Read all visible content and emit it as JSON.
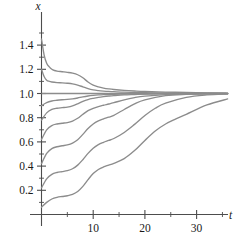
{
  "figure": {
    "kind": "line-plot",
    "background_color": "#ffffff",
    "curve_color": "#8c8c8c",
    "axis_color": "#4d4d4d",
    "text_color": "#1a1a1a"
  },
  "chart_data": {
    "type": "line",
    "title": "",
    "xlabel": "t",
    "ylabel": "x",
    "xlim": [
      -1.2,
      36.5
    ],
    "ylim": [
      0,
      1.52
    ],
    "grid": false,
    "legend": null,
    "x_ticks_major": [
      10,
      20,
      30
    ],
    "x_ticks_minor": [
      5,
      15,
      25,
      35
    ],
    "x_tick_labels": [
      "10",
      "20",
      "30"
    ],
    "y_ticks_major": [
      0.2,
      0.4,
      0.6,
      0.8,
      1.0,
      1.2,
      1.4
    ],
    "y_tick_labels": [
      "0.2",
      "0.4",
      "0.6",
      "0.8",
      "1.0",
      "1.2",
      "1.4"
    ],
    "y_ticks_minor": [
      0.1,
      0.3,
      0.5,
      0.7,
      0.9,
      1.1,
      1.3,
      1.5
    ],
    "equilibrium_value": 1.0,
    "series": [
      {
        "name": "x0 = 1.45",
        "initial_value": 1.45,
        "x": [
          0,
          0.5,
          1,
          1.5,
          2,
          2.5,
          3,
          4,
          5,
          6,
          7,
          8,
          9,
          10,
          11,
          12,
          13,
          14,
          16,
          18,
          20,
          24,
          28,
          32,
          36
        ],
        "values": [
          1.45,
          1.32,
          1.25,
          1.22,
          1.2,
          1.19,
          1.185,
          1.18,
          1.175,
          1.168,
          1.155,
          1.13,
          1.095,
          1.07,
          1.055,
          1.045,
          1.038,
          1.033,
          1.026,
          1.021,
          1.017,
          1.012,
          1.008,
          1.005,
          1.003
        ]
      },
      {
        "name": "x0 = 1.2",
        "initial_value": 1.2,
        "x": [
          0,
          0.5,
          1,
          1.5,
          2,
          3,
          4,
          5,
          6,
          7,
          8,
          9,
          10,
          11,
          12,
          13,
          14,
          16,
          18,
          20,
          24,
          28,
          32,
          36
        ],
        "values": [
          1.2,
          1.14,
          1.11,
          1.1,
          1.095,
          1.09,
          1.088,
          1.085,
          1.08,
          1.07,
          1.055,
          1.04,
          1.03,
          1.024,
          1.02,
          1.017,
          1.015,
          1.011,
          1.009,
          1.007,
          1.005,
          1.003,
          1.002,
          1.001
        ]
      },
      {
        "name": "x0 = 0.9",
        "initial_value": 0.9,
        "x": [
          0,
          1,
          2,
          3,
          4,
          5,
          6,
          7,
          8,
          9,
          10,
          11,
          12,
          13,
          14,
          16,
          18,
          20,
          24,
          28,
          32,
          36
        ],
        "values": [
          0.9,
          0.925,
          0.938,
          0.944,
          0.948,
          0.951,
          0.956,
          0.963,
          0.972,
          0.979,
          0.984,
          0.988,
          0.991,
          0.993,
          0.994,
          0.996,
          0.997,
          0.998,
          0.999,
          0.9995,
          0.9997,
          0.9999
        ]
      },
      {
        "name": "x0 = 0.78",
        "initial_value": 0.78,
        "x": [
          0,
          1,
          2,
          3,
          4,
          5,
          6,
          7,
          8,
          9,
          10,
          11,
          12,
          13,
          14,
          16,
          18,
          20,
          24,
          28,
          32,
          36
        ],
        "values": [
          0.78,
          0.84,
          0.868,
          0.878,
          0.883,
          0.888,
          0.898,
          0.915,
          0.935,
          0.95,
          0.96,
          0.968,
          0.974,
          0.979,
          0.983,
          0.989,
          0.992,
          0.995,
          0.997,
          0.999,
          0.9995,
          0.9998
        ]
      },
      {
        "name": "x0 = 0.62",
        "initial_value": 0.62,
        "x": [
          0,
          1,
          2,
          3,
          4,
          5,
          6,
          7,
          8,
          9,
          10,
          11,
          12,
          13,
          14,
          16,
          18,
          20,
          24,
          28,
          32,
          36
        ],
        "values": [
          0.62,
          0.7,
          0.735,
          0.748,
          0.754,
          0.76,
          0.772,
          0.795,
          0.828,
          0.858,
          0.878,
          0.892,
          0.903,
          0.913,
          0.924,
          0.948,
          0.966,
          0.978,
          0.991,
          0.996,
          0.998,
          0.999
        ]
      },
      {
        "name": "x0 = 0.42",
        "initial_value": 0.42,
        "x": [
          0,
          1,
          2,
          3,
          4,
          5,
          6,
          7,
          8,
          9,
          10,
          11,
          12,
          13,
          14,
          16,
          18,
          20,
          24,
          28,
          32,
          36
        ],
        "values": [
          0.42,
          0.505,
          0.545,
          0.56,
          0.568,
          0.575,
          0.59,
          0.618,
          0.662,
          0.71,
          0.748,
          0.773,
          0.79,
          0.804,
          0.82,
          0.868,
          0.915,
          0.948,
          0.982,
          0.993,
          0.997,
          0.999
        ]
      },
      {
        "name": "x0 = 0.22",
        "initial_value": 0.22,
        "x": [
          0,
          1,
          2,
          3,
          4,
          5,
          6,
          7,
          8,
          9,
          10,
          11,
          12,
          13,
          14,
          16,
          18,
          20,
          22,
          24,
          28,
          32,
          36
        ],
        "values": [
          0.22,
          0.295,
          0.332,
          0.347,
          0.354,
          0.362,
          0.378,
          0.408,
          0.453,
          0.505,
          0.548,
          0.578,
          0.597,
          0.612,
          0.628,
          0.678,
          0.745,
          0.818,
          0.878,
          0.92,
          0.968,
          0.988,
          0.996
        ]
      },
      {
        "name": "x0 = 0.06",
        "initial_value": 0.06,
        "x": [
          0,
          1,
          2,
          3,
          4,
          5,
          6,
          7,
          8,
          9,
          10,
          11,
          12,
          13,
          14,
          16,
          18,
          20,
          22,
          24,
          26,
          28,
          32,
          36
        ],
        "values": [
          0.06,
          0.1,
          0.128,
          0.142,
          0.149,
          0.155,
          0.166,
          0.19,
          0.232,
          0.288,
          0.338,
          0.372,
          0.393,
          0.408,
          0.423,
          0.462,
          0.528,
          0.612,
          0.69,
          0.748,
          0.79,
          0.828,
          0.905,
          0.955
        ]
      }
    ]
  }
}
